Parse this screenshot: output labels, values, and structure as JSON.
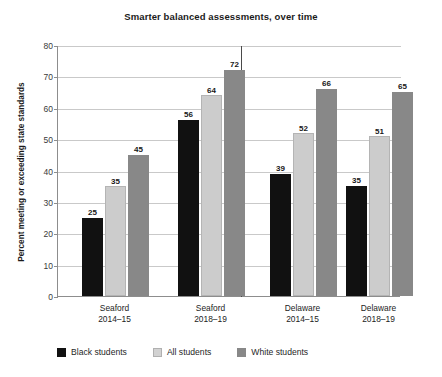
{
  "chart_data": {
    "type": "bar",
    "title": "Smarter balanced assessments, over time",
    "xlabel": "",
    "ylabel": "Percent meeting or exceeding state standards",
    "ylim": [
      0,
      80
    ],
    "ytick_step": 10,
    "yticks": [
      "80",
      "70",
      "60",
      "50",
      "40",
      "30",
      "20",
      "10",
      "0"
    ],
    "grid": true,
    "legend_position": "bottom-left",
    "categories": [
      "Seaford\n2014–15",
      "Seaford\n2018–19",
      "Delaware\n2014–15",
      "Delaware\n2018–19"
    ],
    "category_lines": [
      [
        "Seaford",
        "2014–15"
      ],
      [
        "Seaford",
        "2018–19"
      ],
      [
        "Delaware",
        "2014–15"
      ],
      [
        "Delaware",
        "2018–19"
      ]
    ],
    "series": [
      {
        "name": "Black students",
        "color": "#111111",
        "values": [
          25,
          56,
          39,
          35
        ]
      },
      {
        "name": "All students",
        "color": "#cccccc",
        "values": [
          35,
          64,
          52,
          51
        ]
      },
      {
        "name": "White students",
        "color": "#888888",
        "values": [
          45,
          72,
          66,
          65
        ]
      }
    ],
    "group_separator_after_index": 1
  },
  "legend": {
    "items": [
      {
        "label": "Black students",
        "swatch": "black"
      },
      {
        "label": "All students",
        "swatch": "light"
      },
      {
        "label": "White students",
        "swatch": "mid"
      }
    ]
  },
  "colors": {
    "black_students": "#111111",
    "all_students": "#cccccc",
    "white_students": "#888888",
    "gridline": "#c9c9c9",
    "axis": "#8d8d8d",
    "divider": "#4a4a4a",
    "background": "#ffffff"
  }
}
